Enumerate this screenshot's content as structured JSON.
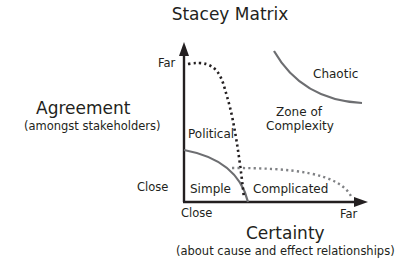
{
  "title": "Stacey Matrix",
  "y_axis": {
    "title": "Agreement",
    "subtitle": "(amongst stakeholders)",
    "tick_far": "Far",
    "tick_close": "Close"
  },
  "x_axis": {
    "title": "Certainty",
    "subtitle": "(about cause and effect relationships)",
    "tick_close": "Close",
    "tick_far": "Far"
  },
  "regions": {
    "simple": "Simple",
    "complicated": "Complicated",
    "political": "Political",
    "complexity_line1": "Zone of",
    "complexity_line2": "Complexity",
    "chaotic": "Chaotic"
  },
  "colors": {
    "axis": "#231f20",
    "curve_grey": "#6d6e71",
    "dotted_black": "#231f20",
    "dotted_grey": "#808285"
  }
}
